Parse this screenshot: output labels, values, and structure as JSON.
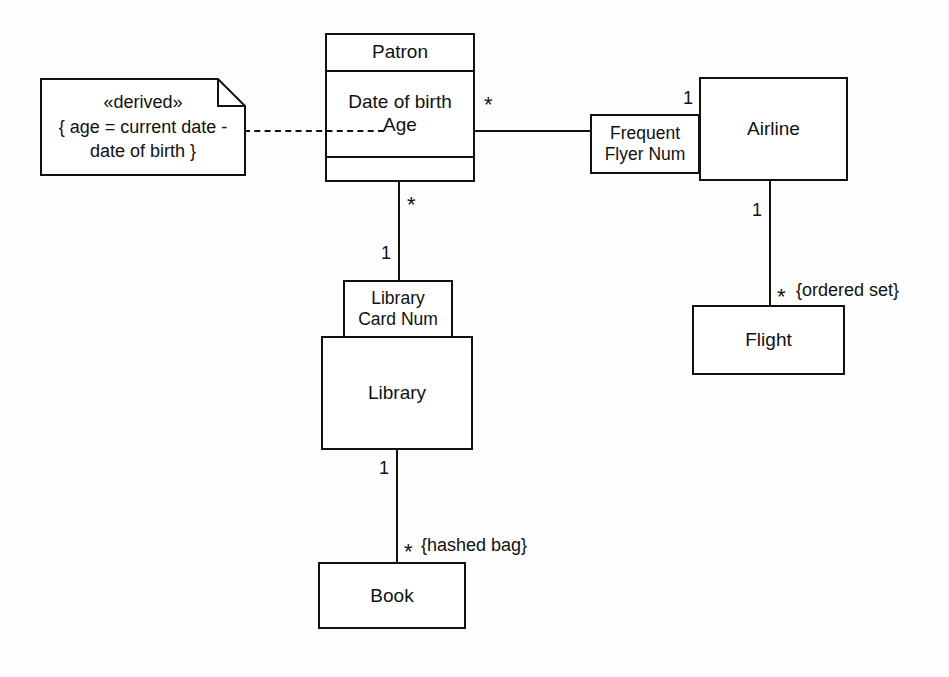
{
  "diagram": {
    "background_color": "#fdfdfd",
    "stroke_color": "#111111"
  },
  "note": {
    "stereotype": "«derived»",
    "line1": "{ age = current date -",
    "line2": "date of birth }"
  },
  "classes": {
    "patron": {
      "name": "Patron",
      "attributes": "Date of birth\nAge",
      "operations": ""
    },
    "airline": {
      "name": "Airline"
    },
    "flight": {
      "name": "Flight"
    },
    "library": {
      "name": "Library"
    },
    "book": {
      "name": "Book"
    }
  },
  "qualifiers": {
    "frequent_flyer": "Frequent\nFlyer Num",
    "library_card": "Library\nCard Num"
  },
  "multiplicities": {
    "patron_to_airline": "*",
    "airline_to_patron": "1",
    "airline_to_flight": "1",
    "flight_to_airline": "*",
    "patron_to_library": "*",
    "library_to_patron": "1",
    "library_to_book": "1",
    "book_to_library": "*"
  },
  "constraints": {
    "flight_collection": "{ordered set}",
    "book_collection": "{hashed bag}"
  }
}
